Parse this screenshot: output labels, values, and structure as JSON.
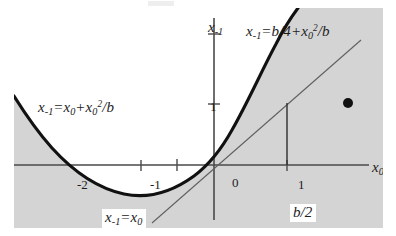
{
  "figure": {
    "type": "math-plot",
    "background_color": "#ffffff",
    "plot_fill_color": "#d4d4d4",
    "region_fill_color": "#ffffff",
    "curve_color": "#111111",
    "axis_color": "#4a4a4a"
  },
  "axes": {
    "x_axis_label": "x",
    "x_axis_sub": "0",
    "y_axis_label": "x",
    "y_axis_sub": "-1",
    "origin_label": "0",
    "x_ticks": [
      "-2",
      "-1",
      "0",
      "1"
    ],
    "y_ticks": [
      "1",
      "x-1"
    ],
    "x_tick_values": [
      -2,
      -1,
      0,
      1
    ],
    "y_tick_values": [
      1
    ],
    "x_range": [
      -5.48,
      4.63
    ],
    "y_range": [
      -1.73,
      4.3
    ],
    "units_per_pixel": 0.0274,
    "pixels_per_unit": 36.5
  },
  "labels": {
    "upper_right_equation": {
      "lhs": "x",
      "lhs_sub": "-1",
      "eq": "=",
      "rhs": "b/4+x",
      "rhs_sub": "0",
      "rhs_sup": "2",
      "rhs_tail": "/b",
      "full": "x-1 = b/4 + x0^2/b"
    },
    "left_equation": {
      "lhs": "x",
      "lhs_sub": "-1",
      "eq": "=",
      "rhs": "x",
      "rhs_sub": "0",
      "plus": "+x",
      "plus_sub": "0",
      "plus_sup": "2",
      "rhs_tail": "/b",
      "full": "x-1 = x0 + x0^2/b"
    },
    "diagonal_equation": {
      "lhs": "x",
      "lhs_sub": "-1",
      "eq": "=",
      "rhs": "x",
      "rhs_sub": "0",
      "full": "x-1 = x0",
      "boxed": true
    },
    "b_half": {
      "text": "b/2",
      "boxed": true
    }
  },
  "curves": [
    {
      "name": "parabola",
      "equation": "x-1 = x0 + x0^2/b",
      "style": "thick-solid",
      "color": "#111111",
      "vertex": [
        -1,
        -0.25
      ],
      "roots": [
        -2,
        0
      ]
    },
    {
      "name": "identity-line",
      "equation": "x-1 = x0",
      "style": "thin-solid",
      "color": "#555555",
      "slope": 1,
      "intercept": 0
    },
    {
      "name": "drop-line",
      "style": "thin-vertical",
      "color": "#333333",
      "at_x": 1,
      "from_y": 0,
      "to_y": 1.7
    }
  ],
  "markers": [
    {
      "name": "point-marker",
      "shape": "filled-circle",
      "color": "#111111",
      "x": 3.67,
      "y": 1.7,
      "radius_px": 5
    }
  ]
}
